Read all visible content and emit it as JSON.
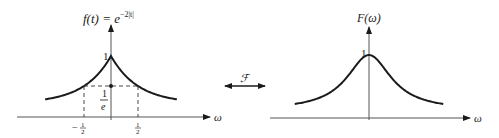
{
  "left_plot": {
    "title_lhs": "f(t) = e",
    "title_exp": "−2|t|",
    "function": "exp(-2|t|)",
    "peak_label": "1",
    "level_label_num": "1",
    "level_label_den": "e",
    "tick_neg": "−",
    "tick_half_num": "1",
    "tick_half_den": "2",
    "axis_label": "ω",
    "t_range": [
      -1.22,
      1.22
    ],
    "marked_t": [
      -0.5,
      0.5
    ],
    "marked_value": "1/e"
  },
  "transform": {
    "symbol": "ℱ"
  },
  "right_plot": {
    "title": "F(ω)",
    "function": "4/(4+ω²)",
    "peak_label": "1",
    "axis_label": "ω",
    "w_range": [
      -5.5,
      5.5
    ]
  },
  "colors": {
    "ink": "#1a1a1a",
    "axis": "#555555"
  }
}
